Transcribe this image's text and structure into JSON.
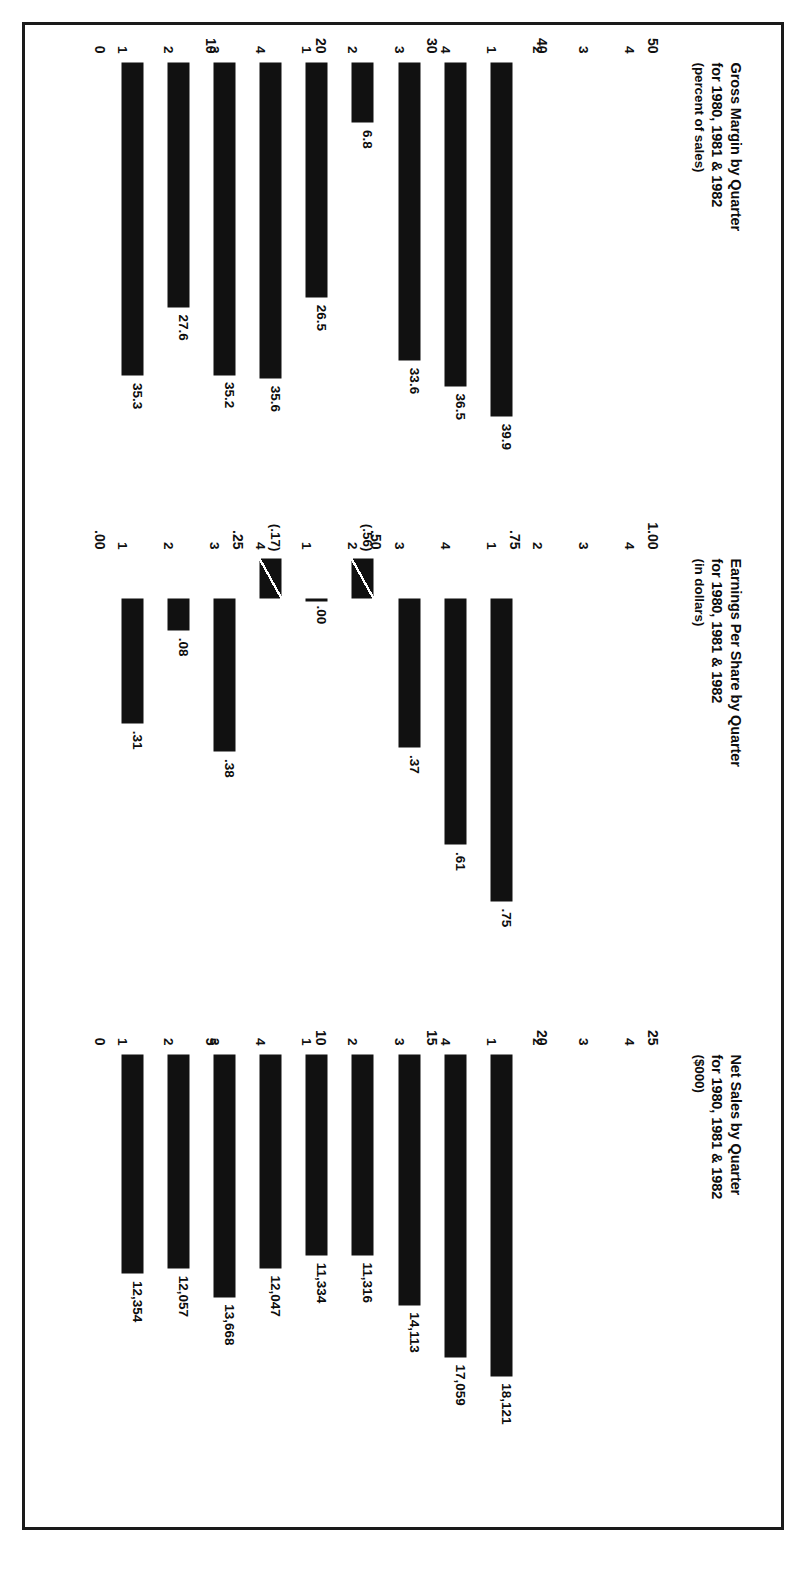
{
  "caption": "Quarterly Bar Charts from Verbatim's First Quarter 1981 Shareholder's Report",
  "charts": [
    {
      "id": "net-sales",
      "title": "Net Sales by Quarter",
      "title_line2": "for 1980, 1981 & 1982",
      "subtitle": "($000)",
      "axis_ticks": [
        "0",
        "5",
        "10",
        "15",
        "20",
        "25"
      ],
      "axis_max": 25,
      "quarters": [
        "1",
        "2",
        "3",
        "4",
        "1",
        "2",
        "3",
        "4",
        "1",
        "2",
        "3",
        "4"
      ],
      "values": [
        12.354,
        12.057,
        13.668,
        12.047,
        11.334,
        11.316,
        14.113,
        17.059,
        18.121,
        null,
        null,
        null
      ],
      "value_labels": [
        "12,354",
        "12,057",
        "13,668",
        "12,047",
        "11,334",
        "11,316",
        "14,113",
        "17,059",
        "18,121",
        "",
        "",
        ""
      ]
    },
    {
      "id": "earnings-per-share",
      "title": "Earnings Per Share by Quarter",
      "title_line2": "for 1980, 1981 & 1982",
      "subtitle": "(in dollars)",
      "axis_ticks": [
        ".00",
        ".25",
        ".50",
        ".75",
        "1.00"
      ],
      "axis_max": 1.0,
      "quarters": [
        "1",
        "2",
        "3",
        "4",
        "1",
        "2",
        "3",
        "4",
        "1",
        "2",
        "3",
        "4"
      ],
      "values": [
        0.31,
        0.08,
        0.38,
        -0.17,
        0.0,
        -0.56,
        0.37,
        0.61,
        0.75,
        null,
        null,
        null
      ],
      "value_labels": [
        ".31",
        ".08",
        ".38",
        "(.17)",
        ".00",
        "(.56)",
        ".37",
        ".61",
        ".75",
        "",
        "",
        ""
      ]
    },
    {
      "id": "gross-margin",
      "title": "Gross Margin by Quarter",
      "title_line2": "for 1980, 1981 & 1982",
      "subtitle": "(percent of sales)",
      "axis_ticks": [
        "0",
        "10",
        "20",
        "30",
        "40",
        "50"
      ],
      "axis_max": 50,
      "quarters": [
        "1",
        "2",
        "3",
        "4",
        "1",
        "2",
        "3",
        "4",
        "1",
        "2",
        "3",
        "4"
      ],
      "values": [
        35.3,
        27.6,
        35.2,
        35.6,
        26.5,
        6.8,
        33.6,
        36.5,
        39.9,
        null,
        null,
        null
      ],
      "value_labels": [
        "35.3",
        "27.6",
        "35.2",
        "35.6",
        "26.5",
        "6.8",
        "33.6",
        "36.5",
        "39.9",
        "",
        "",
        ""
      ]
    }
  ],
  "chart_data": [
    {
      "type": "bar",
      "title": "Net Sales by Quarter for 1980, 1981 & 1982 ($000)",
      "xlabel": "Quarter",
      "ylabel": "Net Sales ($000, thousands shown as 0-25)",
      "categories": [
        "1980 Q1",
        "1980 Q2",
        "1980 Q3",
        "1980 Q4",
        "1981 Q1",
        "1981 Q2",
        "1981 Q3",
        "1981 Q4",
        "1982 Q1",
        "1982 Q2",
        "1982 Q3",
        "1982 Q4"
      ],
      "values": [
        12354,
        12057,
        13668,
        12047,
        11334,
        11316,
        14113,
        17059,
        18121,
        null,
        null,
        null
      ],
      "data_labels": [
        "12,354",
        "12,057",
        "13,668",
        "12,047",
        "11,334",
        "11,316",
        "14,113",
        "17,059",
        "18,121",
        "",
        "",
        ""
      ],
      "ylim": [
        0,
        25000
      ],
      "yticks": [
        0,
        5000,
        10000,
        15000,
        20000,
        25000
      ],
      "ytick_labels": [
        "0",
        "5",
        "10",
        "15",
        "20",
        "25"
      ],
      "grid": false,
      "legend": "none",
      "orientation": "horizontal"
    },
    {
      "type": "bar",
      "title": "Earnings Per Share by Quarter for 1980, 1981 & 1982 (in dollars)",
      "xlabel": "Quarter",
      "ylabel": "Earnings Per Share (dollars)",
      "categories": [
        "1980 Q1",
        "1980 Q2",
        "1980 Q3",
        "1980 Q4",
        "1981 Q1",
        "1981 Q2",
        "1981 Q3",
        "1981 Q4",
        "1982 Q1",
        "1982 Q2",
        "1982 Q3",
        "1982 Q4"
      ],
      "values": [
        0.31,
        0.08,
        0.38,
        -0.17,
        0.0,
        -0.56,
        0.37,
        0.61,
        0.75,
        null,
        null,
        null
      ],
      "data_labels": [
        ".31",
        ".08",
        ".38",
        "(.17)",
        ".00",
        "(.56)",
        ".37",
        ".61",
        ".75",
        "",
        "",
        ""
      ],
      "ylim": [
        0,
        1.0
      ],
      "yticks": [
        0,
        0.25,
        0.5,
        0.75,
        1.0
      ],
      "ytick_labels": [
        ".00",
        ".25",
        ".50",
        ".75",
        "1.00"
      ],
      "grid": false,
      "legend": "none",
      "orientation": "horizontal",
      "notes": "Negative values drawn as broken/slashed bars extending left of zero; labels in parentheses."
    },
    {
      "type": "bar",
      "title": "Gross Margin by Quarter for 1980, 1981 & 1982 (percent of sales)",
      "xlabel": "Quarter",
      "ylabel": "Gross Margin (percent of sales)",
      "categories": [
        "1980 Q1",
        "1980 Q2",
        "1980 Q3",
        "1980 Q4",
        "1981 Q1",
        "1981 Q2",
        "1981 Q3",
        "1981 Q4",
        "1982 Q1",
        "1982 Q2",
        "1982 Q3",
        "1982 Q4"
      ],
      "values": [
        35.3,
        27.6,
        35.2,
        35.6,
        26.5,
        6.8,
        33.6,
        36.5,
        39.9,
        null,
        null,
        null
      ],
      "data_labels": [
        "35.3",
        "27.6",
        "35.2",
        "35.6",
        "26.5",
        "6.8",
        "33.6",
        "36.5",
        "39.9",
        "",
        "",
        ""
      ],
      "ylim": [
        0,
        50
      ],
      "yticks": [
        0,
        10,
        20,
        30,
        40,
        50
      ],
      "ytick_labels": [
        "0",
        "10",
        "20",
        "30",
        "40",
        "50"
      ],
      "grid": false,
      "legend": "none",
      "orientation": "horizontal"
    }
  ]
}
